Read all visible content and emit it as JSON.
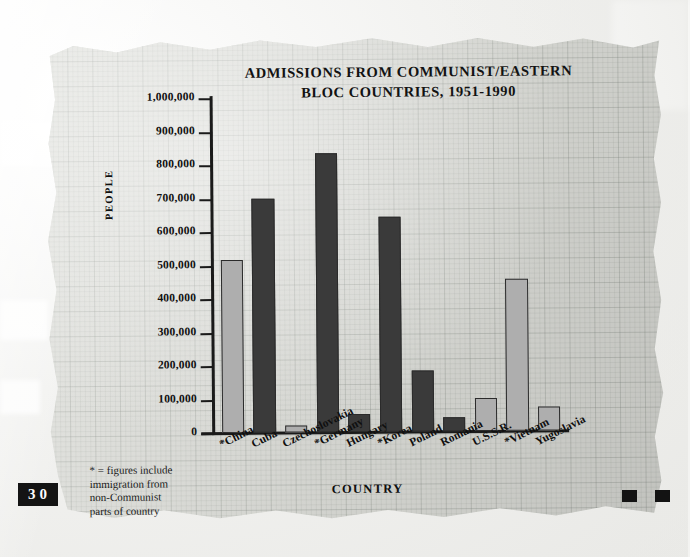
{
  "chart_data": {
    "type": "bar",
    "title": "ADMISSIONS FROM COMMUNIST/EASTERN BLOC COUNTRIES, 1951-1990",
    "title_line1": "ADMISSIONS FROM COMMUNIST/EASTERN",
    "title_line2": "BLOC COUNTRIES, 1951-1990",
    "xlabel": "COUNTRY",
    "ylabel": "PEOPLE",
    "ylim": [
      0,
      1000000
    ],
    "ytick_labels": [
      "1,000,000",
      "900,000",
      "800,000",
      "700,000",
      "600,000",
      "500,000",
      "400,000",
      "300,000",
      "200,000",
      "100,000",
      "0"
    ],
    "ytick_values": [
      1000000,
      900000,
      800000,
      700000,
      600000,
      500000,
      400000,
      300000,
      200000,
      100000,
      0
    ],
    "grid": true,
    "legend": "none",
    "categories": [
      "*China",
      "Cuba",
      "Czechoslovakia",
      "*Germany",
      "Hungary",
      "*Korea",
      "Poland",
      "Romania",
      "U.S.S.R.",
      "*Vietnam",
      "Yugoslavia"
    ],
    "values": [
      515000,
      700000,
      20000,
      832000,
      55000,
      642000,
      183000,
      42000,
      98000,
      455000,
      72000
    ],
    "bar_shades": [
      "light",
      "dark",
      "light",
      "dark",
      "dark",
      "dark",
      "dark",
      "dark",
      "light",
      "light",
      "light"
    ],
    "annotations": [
      "* = figures include immigration from non-Communist parts of country"
    ]
  },
  "footnote": {
    "line1": "* = figures include",
    "line2": "immigration from",
    "line3": "non-Communist",
    "line4": "parts of country"
  },
  "page": {
    "number": "30"
  },
  "colors": {
    "bar_light": "#aeaeae",
    "bar_dark": "#3a3a3a",
    "axis": "#1a1a1a",
    "paper": "#dedfda",
    "ink": "#101010"
  }
}
